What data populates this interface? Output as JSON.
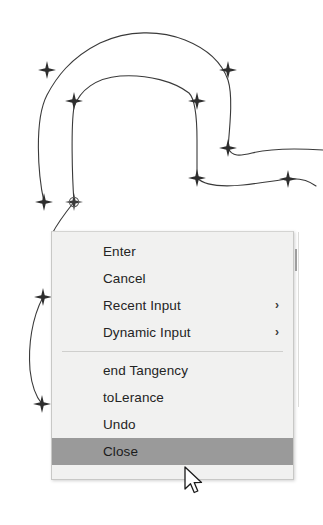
{
  "app": {
    "type": "cad-drawing-context-menu",
    "background_color": "#ffffff",
    "drawing_stroke_color": "#3a3a3a"
  },
  "drawing": {
    "description": "CAD spline curves with grip node markers",
    "grip_marker_color": "#2e2e2e",
    "grip_markers": [
      {
        "name": "grip-1",
        "x": 47,
        "y": 70,
        "shape": "star"
      },
      {
        "name": "grip-2",
        "x": 74,
        "y": 101,
        "shape": "star"
      },
      {
        "name": "grip-3",
        "x": 197,
        "y": 101,
        "shape": "star"
      },
      {
        "name": "grip-4",
        "x": 228,
        "y": 70,
        "shape": "star"
      },
      {
        "name": "grip-5",
        "x": 228,
        "y": 148,
        "shape": "star"
      },
      {
        "name": "grip-6",
        "x": 197,
        "y": 178,
        "shape": "star"
      },
      {
        "name": "grip-7",
        "x": 288,
        "y": 179,
        "shape": "star"
      },
      {
        "name": "grip-8",
        "x": 44,
        "y": 202,
        "shape": "star"
      },
      {
        "name": "grip-9",
        "x": 74,
        "y": 202,
        "shape": "star-circled"
      },
      {
        "name": "grip-10",
        "x": 43,
        "y": 297,
        "shape": "star"
      },
      {
        "name": "grip-11",
        "x": 42,
        "y": 404,
        "shape": "star"
      }
    ]
  },
  "context_menu": {
    "name": "cad-right-click-menu",
    "background_color": "#f1f1f0",
    "border_color": "#c8c8c6",
    "highlight_color": "#9a9a9a",
    "items": [
      {
        "label": "Enter",
        "submenu": false,
        "selected": false
      },
      {
        "label": "Cancel",
        "submenu": false,
        "selected": false
      },
      {
        "label": "Recent Input",
        "submenu": true,
        "selected": false
      },
      {
        "label": "Dynamic Input",
        "submenu": true,
        "selected": false
      }
    ],
    "items_after_separator": [
      {
        "label": "end Tangency",
        "submenu": false,
        "selected": false
      },
      {
        "label": "toLerance",
        "submenu": false,
        "selected": false
      },
      {
        "label": "Undo",
        "submenu": false,
        "selected": false
      },
      {
        "label": "Close",
        "submenu": false,
        "selected": true
      }
    ],
    "submenu_arrow_glyph": "›",
    "scrollbar": {
      "visible": true,
      "thumb_color": "#9e9e9e"
    }
  },
  "cursor": {
    "name": "mouse-pointer",
    "x": 184,
    "y": 466,
    "style": "arrow"
  }
}
